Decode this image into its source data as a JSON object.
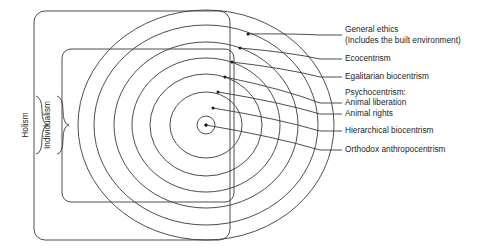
{
  "diagram": {
    "background_color": "#ffffff",
    "stroke_color": "#3a3a3a",
    "text_color": "#1d1d1d",
    "center": {
      "x": 206,
      "y": 125
    },
    "axis_labels": [
      {
        "id": "holism",
        "text": "Holism",
        "x": 28,
        "y": 125
      },
      {
        "id": "individualism",
        "text": "Individualism",
        "x": 50,
        "y": 125
      }
    ],
    "labels": [
      {
        "id": "general-ethics",
        "lines": [
          "General ethics",
          "(Includes the built environment)"
        ],
        "text_x": 345,
        "line_y": [
          30,
          41
        ],
        "leader": {
          "end_x": 342,
          "end_y": 35,
          "dot_x": 248,
          "dot_y": 34
        },
        "has_leader": true
      },
      {
        "id": "ecocentrism",
        "lines": [
          "Ecocentrism"
        ],
        "text_x": 345,
        "line_y": [
          59
        ],
        "leader": {
          "end_x": 342,
          "end_y": 59,
          "dot_x": 240,
          "dot_y": 48
        },
        "has_leader": true
      },
      {
        "id": "egalitarian-biocentrism",
        "lines": [
          "Egalitarian biocentrism"
        ],
        "text_x": 345,
        "line_y": [
          77
        ],
        "leader": {
          "end_x": 342,
          "end_y": 77,
          "dot_x": 232,
          "dot_y": 62
        },
        "has_leader": true
      },
      {
        "id": "psychocentrism-header",
        "lines": [
          "Psychocentrism:"
        ],
        "text_x": 345,
        "line_y": [
          93
        ],
        "has_leader": false
      },
      {
        "id": "animal-liberation",
        "lines": [
          "Animal liberation"
        ],
        "text_x": 345,
        "line_y": [
          103
        ],
        "leader": {
          "end_x": 342,
          "end_y": 103,
          "dot_x": 225,
          "dot_y": 77
        },
        "has_leader": true
      },
      {
        "id": "animal-rights",
        "lines": [
          "Animal rights"
        ],
        "text_x": 345,
        "line_y": [
          114
        ],
        "leader": {
          "end_x": 342,
          "end_y": 114,
          "dot_x": 218,
          "dot_y": 92
        },
        "has_leader": true
      },
      {
        "id": "hierarchical-biocentrism",
        "lines": [
          "Hierarchical biocentrism"
        ],
        "text_x": 345,
        "line_y": [
          131
        ],
        "leader": {
          "end_x": 342,
          "end_y": 131,
          "dot_x": 213,
          "dot_y": 108
        },
        "has_leader": true
      },
      {
        "id": "orthodox-anthropocentrism",
        "lines": [
          "Orthodox anthropocentrism"
        ],
        "text_x": 345,
        "line_y": [
          150
        ],
        "leader": {
          "end_x": 342,
          "end_y": 150,
          "dot_x": 206,
          "dot_y": 125
        },
        "has_leader": true
      }
    ],
    "rings": [
      {
        "id": "ring-general-ethics",
        "rx": 128,
        "ry": 115,
        "corner": 115
      },
      {
        "id": "ring-ecocentrism",
        "rx": 112,
        "ry": 100,
        "corner": 100
      },
      {
        "id": "ring-egalitarian-biocentrism",
        "rx": 92,
        "ry": 83,
        "corner": 83
      },
      {
        "id": "ring-animal-liberation",
        "rx": 74,
        "ry": 67,
        "corner": 67
      },
      {
        "id": "ring-animal-rights",
        "rx": 56,
        "ry": 51,
        "corner": 51
      },
      {
        "id": "ring-hierarchical-biocentrism",
        "rx": 36,
        "ry": 33,
        "corner": 33
      },
      {
        "id": "ring-orthodox-anthropocentrism",
        "rx": 9,
        "ry": 9,
        "corner": 9
      }
    ],
    "boxes": [
      {
        "id": "holism-box",
        "x": 34,
        "y": 11,
        "width": 196,
        "height": 229,
        "radius": 11
      },
      {
        "id": "individualism-box",
        "x": 62,
        "y": 49,
        "width": 172,
        "height": 153,
        "radius": 9
      }
    ]
  }
}
